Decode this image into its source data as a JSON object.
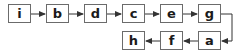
{
  "diagram": {
    "type": "linked-list-flow",
    "nodes": [
      {
        "id": "i",
        "label": "i",
        "x": 8,
        "y": 4
      },
      {
        "id": "b",
        "label": "b",
        "x": 46,
        "y": 4
      },
      {
        "id": "d",
        "label": "d",
        "x": 84,
        "y": 4
      },
      {
        "id": "c",
        "label": "c",
        "x": 122,
        "y": 4
      },
      {
        "id": "e",
        "label": "e",
        "x": 160,
        "y": 4
      },
      {
        "id": "g",
        "label": "g",
        "x": 198,
        "y": 4
      },
      {
        "id": "h",
        "label": "h",
        "x": 122,
        "y": 31
      },
      {
        "id": "f",
        "label": "f",
        "x": 160,
        "y": 31
      },
      {
        "id": "a",
        "label": "a",
        "x": 198,
        "y": 31
      }
    ],
    "edges": [
      {
        "from": "i",
        "to": "b"
      },
      {
        "from": "b",
        "to": "d"
      },
      {
        "from": "d",
        "to": "c"
      },
      {
        "from": "c",
        "to": "e"
      },
      {
        "from": "e",
        "to": "g"
      },
      {
        "from": "g",
        "to": "a"
      },
      {
        "from": "a",
        "to": "f"
      },
      {
        "from": "f",
        "to": "h"
      }
    ],
    "colors": {
      "border": "#6b6b6b",
      "arrow": "#333333",
      "text": "#1a1a1a"
    }
  }
}
